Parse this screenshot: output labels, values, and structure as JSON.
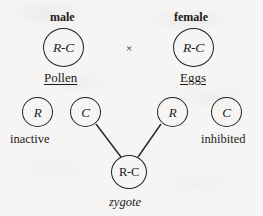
{
  "diagram": {
    "title_absent": true,
    "parents": [
      {
        "sex_label": "male",
        "genotype": "R-C",
        "gamete_source": "Pollen"
      },
      {
        "sex_label": "female",
        "genotype": "R-C",
        "gamete_source": "Eggs"
      }
    ],
    "cross_symbol": "×",
    "gametes": [
      {
        "allele": "R",
        "state": "inactive",
        "contributes": false
      },
      {
        "allele": "C",
        "state": "",
        "contributes": true
      },
      {
        "allele": "R",
        "state": "",
        "contributes": true
      },
      {
        "allele": "C",
        "state": "inhibited",
        "contributes": false
      }
    ],
    "zygote": {
      "genotype": "R-C",
      "label": "zygote"
    },
    "colors": {
      "ink": "#232323",
      "background": "#f6f5f3"
    }
  }
}
